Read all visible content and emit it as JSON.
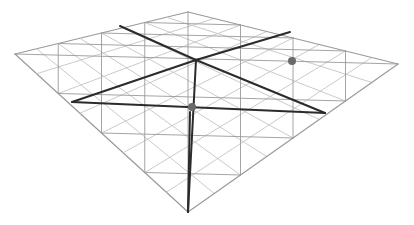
{
  "diagram": {
    "background": "#ffffff",
    "colors": {
      "thin_line": "#9a9a9a",
      "light_line": "#c4c4c4",
      "heavy_line": "#2b2b2b",
      "node": "#6a6a6a"
    },
    "corners": {
      "far_left": [
        15,
        54
      ],
      "far_top": [
        188,
        12
      ],
      "far_right": [
        398,
        64
      ],
      "near_bottom": [
        188,
        212
      ]
    },
    "divisions": 8,
    "heavy_lines": [
      [
        [
          120,
          26
        ],
        [
          196,
          60
        ]
      ],
      [
        [
          196,
          60
        ],
        [
          325,
          113
        ]
      ],
      [
        [
          72,
          102
        ],
        [
          196,
          60
        ]
      ],
      [
        [
          196,
          60
        ],
        [
          290,
          32
        ]
      ],
      [
        [
          196,
          60
        ],
        [
          188,
          212
        ]
      ],
      [
        [
          72,
          102
        ],
        [
          325,
          113
        ]
      ],
      [
        [
          190,
          112
        ],
        [
          188,
          212
        ]
      ]
    ],
    "nodes": [
      {
        "name": "center-node",
        "x": 192,
        "y": 107,
        "r": 4
      },
      {
        "name": "right-node",
        "x": 292,
        "y": 61,
        "r": 4
      }
    ]
  }
}
